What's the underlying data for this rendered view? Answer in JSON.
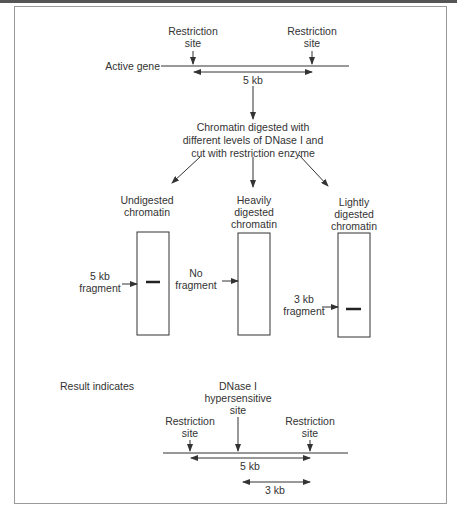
{
  "top": {
    "gene_label": "Active gene",
    "restriction_left": [
      "Restriction",
      "site"
    ],
    "restriction_right": [
      "Restriction",
      "site"
    ],
    "distance": "5 kb"
  },
  "process": {
    "lines": [
      "Chromatin digested with",
      "different levels of DNase I and",
      "cut with restriction enzyme"
    ]
  },
  "lanes": [
    {
      "title": [
        "Undigested",
        "chromatin"
      ],
      "marker": [
        "5 kb",
        "fragment"
      ],
      "band": true
    },
    {
      "title": [
        "Heavily",
        "digested",
        "chromatin"
      ],
      "marker": [
        "No",
        "fragment"
      ],
      "band": false
    },
    {
      "title": [
        "Lightly",
        "digested",
        "chromatin"
      ],
      "marker": [
        "3 kb",
        "fragment"
      ],
      "band": true
    }
  ],
  "result": {
    "label": "Result indicates",
    "dnase_label": [
      "DNase I",
      "hypersensitive",
      "site"
    ],
    "restriction_left": [
      "Restriction",
      "site"
    ],
    "restriction_right": [
      "Restriction",
      "site"
    ],
    "distance_full": "5 kb",
    "distance_partial": "3 kb"
  },
  "colors": {
    "line": "#333333",
    "frame": "#9a9a9a",
    "text": "#333333"
  }
}
